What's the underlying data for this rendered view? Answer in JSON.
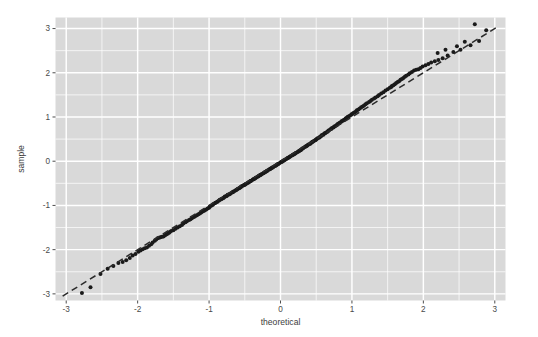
{
  "chart_data": {
    "type": "scatter",
    "title": "",
    "subtitle": "",
    "xlabel": "theoretical",
    "ylabel": "sample",
    "xlim": [
      -3.15,
      3.15
    ],
    "ylim": [
      -3.15,
      3.25
    ],
    "x_ticks": [
      -3,
      -2,
      -1,
      0,
      1,
      2,
      3
    ],
    "x_tick_labels": [
      "-3",
      "-2",
      "-1",
      "0",
      "1",
      "2",
      "3"
    ],
    "y_ticks": [
      -3,
      -2,
      -1,
      0,
      1,
      2,
      3
    ],
    "y_tick_labels": [
      "-3",
      "-2",
      "-1",
      "0",
      "1",
      "2",
      "3"
    ],
    "grid": true,
    "grid_major_step": 1,
    "grid_minor_step": 0.5,
    "legend": "none",
    "panel_background": "#d9d9d9",
    "grid_color": "#ffffff",
    "point_color": "#1a1a1a",
    "point_radius": 2.0,
    "reference_line": {
      "style": "dashed",
      "color": "#2b2b2b",
      "slope": 1.0,
      "intercept": 0.0,
      "x_from": -3.05,
      "x_to": 3.05
    },
    "annotations": [],
    "series": [
      {
        "name": "sample quantiles",
        "n_points": 260,
        "points": [
          [
            -2.66,
            -2.85
          ],
          [
            -2.42,
            -2.43
          ],
          [
            -2.27,
            -2.3
          ],
          [
            -2.16,
            -2.24
          ],
          [
            -2.07,
            -2.13
          ],
          [
            -1.99,
            -2.05
          ],
          [
            -1.93,
            -1.99
          ],
          [
            -1.87,
            -1.95
          ],
          [
            -1.81,
            -1.88
          ],
          [
            -1.76,
            -1.8
          ],
          [
            -1.72,
            -1.74
          ],
          [
            -1.68,
            -1.72
          ],
          [
            -1.64,
            -1.7
          ],
          [
            -1.6,
            -1.66
          ],
          [
            -1.56,
            -1.62
          ],
          [
            -1.53,
            -1.58
          ],
          [
            -1.5,
            -1.56
          ],
          [
            -1.47,
            -1.53
          ],
          [
            -1.44,
            -1.5
          ],
          [
            -1.41,
            -1.47
          ],
          [
            -1.38,
            -1.44
          ],
          [
            -1.36,
            -1.41
          ],
          [
            -1.33,
            -1.38
          ],
          [
            -1.31,
            -1.36
          ],
          [
            -1.28,
            -1.33
          ],
          [
            -1.26,
            -1.31
          ],
          [
            -1.24,
            -1.29
          ],
          [
            -1.21,
            -1.26
          ],
          [
            -1.19,
            -1.24
          ],
          [
            -1.17,
            -1.22
          ],
          [
            -1.15,
            -1.2
          ],
          [
            -1.13,
            -1.18
          ],
          [
            -1.11,
            -1.16
          ],
          [
            -1.09,
            -1.14
          ],
          [
            -1.07,
            -1.12
          ],
          [
            -1.06,
            -1.11
          ],
          [
            -1.04,
            -1.09
          ],
          [
            -1.02,
            -1.07
          ],
          [
            -1.0,
            -1.05
          ],
          [
            -0.99,
            -1.03
          ],
          [
            -0.97,
            -1.01
          ],
          [
            -0.95,
            -0.99
          ],
          [
            -0.94,
            -0.97
          ],
          [
            -0.92,
            -0.95
          ],
          [
            -0.91,
            -0.94
          ],
          [
            -0.89,
            -0.92
          ],
          [
            -0.88,
            -0.91
          ],
          [
            -0.86,
            -0.89
          ],
          [
            -0.85,
            -0.87
          ],
          [
            -0.83,
            -0.86
          ],
          [
            -0.82,
            -0.85
          ],
          [
            -0.8,
            -0.83
          ],
          [
            -0.79,
            -0.82
          ],
          [
            -0.78,
            -0.8
          ],
          [
            -0.76,
            -0.79
          ],
          [
            -0.75,
            -0.78
          ],
          [
            -0.74,
            -0.76
          ],
          [
            -0.72,
            -0.75
          ],
          [
            -0.71,
            -0.74
          ],
          [
            -0.7,
            -0.73
          ],
          [
            -0.68,
            -0.71
          ],
          [
            -0.67,
            -0.7
          ],
          [
            -0.66,
            -0.69
          ],
          [
            -0.65,
            -0.68
          ],
          [
            -0.63,
            -0.66
          ],
          [
            -0.62,
            -0.65
          ],
          [
            -0.61,
            -0.64
          ],
          [
            -0.6,
            -0.63
          ],
          [
            -0.58,
            -0.61
          ],
          [
            -0.57,
            -0.6
          ],
          [
            -0.56,
            -0.59
          ],
          [
            -0.55,
            -0.58
          ],
          [
            -0.54,
            -0.56
          ],
          [
            -0.52,
            -0.55
          ],
          [
            -0.51,
            -0.54
          ],
          [
            -0.5,
            -0.53
          ],
          [
            -0.49,
            -0.52
          ],
          [
            -0.48,
            -0.51
          ],
          [
            -0.46,
            -0.49
          ],
          [
            -0.45,
            -0.48
          ],
          [
            -0.44,
            -0.47
          ],
          [
            -0.43,
            -0.46
          ],
          [
            -0.42,
            -0.45
          ],
          [
            -0.41,
            -0.44
          ],
          [
            -0.39,
            -0.42
          ],
          [
            -0.38,
            -0.41
          ],
          [
            -0.37,
            -0.4
          ],
          [
            -0.36,
            -0.39
          ],
          [
            -0.35,
            -0.38
          ],
          [
            -0.34,
            -0.37
          ],
          [
            -0.32,
            -0.35
          ],
          [
            -0.31,
            -0.34
          ],
          [
            -0.3,
            -0.33
          ],
          [
            -0.29,
            -0.32
          ],
          [
            -0.28,
            -0.31
          ],
          [
            -0.27,
            -0.3
          ],
          [
            -0.26,
            -0.29
          ],
          [
            -0.24,
            -0.27
          ],
          [
            -0.23,
            -0.26
          ],
          [
            -0.22,
            -0.25
          ],
          [
            -0.21,
            -0.24
          ],
          [
            -0.2,
            -0.23
          ],
          [
            -0.19,
            -0.22
          ],
          [
            -0.18,
            -0.21
          ],
          [
            -0.16,
            -0.19
          ],
          [
            -0.15,
            -0.18
          ],
          [
            -0.14,
            -0.17
          ],
          [
            -0.13,
            -0.16
          ],
          [
            -0.12,
            -0.15
          ],
          [
            -0.11,
            -0.14
          ],
          [
            -0.1,
            -0.13
          ],
          [
            -0.08,
            -0.11
          ],
          [
            -0.07,
            -0.1
          ],
          [
            -0.06,
            -0.09
          ],
          [
            -0.05,
            -0.08
          ],
          [
            -0.04,
            -0.07
          ],
          [
            -0.03,
            -0.06
          ],
          [
            -0.02,
            -0.05
          ],
          [
            0.0,
            -0.03
          ],
          [
            0.01,
            -0.02
          ],
          [
            0.02,
            -0.01
          ],
          [
            0.03,
            0.0
          ],
          [
            0.04,
            0.01
          ],
          [
            0.05,
            0.02
          ],
          [
            0.06,
            0.03
          ],
          [
            0.08,
            0.05
          ],
          [
            0.09,
            0.06
          ],
          [
            0.1,
            0.07
          ],
          [
            0.11,
            0.08
          ],
          [
            0.12,
            0.09
          ],
          [
            0.13,
            0.1
          ],
          [
            0.14,
            0.11
          ],
          [
            0.16,
            0.13
          ],
          [
            0.17,
            0.14
          ],
          [
            0.18,
            0.15
          ],
          [
            0.19,
            0.16
          ],
          [
            0.2,
            0.17
          ],
          [
            0.21,
            0.18
          ],
          [
            0.22,
            0.19
          ],
          [
            0.24,
            0.21
          ],
          [
            0.25,
            0.22
          ],
          [
            0.26,
            0.23
          ],
          [
            0.27,
            0.24
          ],
          [
            0.28,
            0.25
          ],
          [
            0.29,
            0.26
          ],
          [
            0.3,
            0.28
          ],
          [
            0.31,
            0.29
          ],
          [
            0.32,
            0.3
          ],
          [
            0.34,
            0.32
          ],
          [
            0.35,
            0.33
          ],
          [
            0.36,
            0.34
          ],
          [
            0.37,
            0.35
          ],
          [
            0.38,
            0.36
          ],
          [
            0.39,
            0.38
          ],
          [
            0.41,
            0.39
          ],
          [
            0.42,
            0.4
          ],
          [
            0.43,
            0.42
          ],
          [
            0.44,
            0.43
          ],
          [
            0.45,
            0.44
          ],
          [
            0.46,
            0.45
          ],
          [
            0.48,
            0.47
          ],
          [
            0.49,
            0.48
          ],
          [
            0.5,
            0.49
          ],
          [
            0.51,
            0.51
          ],
          [
            0.52,
            0.52
          ],
          [
            0.54,
            0.53
          ],
          [
            0.55,
            0.55
          ],
          [
            0.56,
            0.56
          ],
          [
            0.57,
            0.57
          ],
          [
            0.58,
            0.59
          ],
          [
            0.6,
            0.6
          ],
          [
            0.61,
            0.62
          ],
          [
            0.62,
            0.63
          ],
          [
            0.63,
            0.64
          ],
          [
            0.65,
            0.66
          ],
          [
            0.66,
            0.67
          ],
          [
            0.67,
            0.69
          ],
          [
            0.68,
            0.7
          ],
          [
            0.7,
            0.72
          ],
          [
            0.71,
            0.73
          ],
          [
            0.72,
            0.75
          ],
          [
            0.74,
            0.76
          ],
          [
            0.75,
            0.78
          ],
          [
            0.76,
            0.79
          ],
          [
            0.78,
            0.81
          ],
          [
            0.79,
            0.82
          ],
          [
            0.8,
            0.84
          ],
          [
            0.82,
            0.86
          ],
          [
            0.83,
            0.87
          ],
          [
            0.85,
            0.89
          ],
          [
            0.86,
            0.91
          ],
          [
            0.88,
            0.92
          ],
          [
            0.89,
            0.94
          ],
          [
            0.91,
            0.96
          ],
          [
            0.92,
            0.98
          ],
          [
            0.94,
            1.0
          ],
          [
            0.95,
            1.01
          ],
          [
            0.97,
            1.03
          ],
          [
            0.99,
            1.05
          ],
          [
            1.0,
            1.07
          ],
          [
            1.02,
            1.09
          ],
          [
            1.04,
            1.11
          ],
          [
            1.06,
            1.13
          ],
          [
            1.07,
            1.15
          ],
          [
            1.09,
            1.17
          ],
          [
            1.11,
            1.19
          ],
          [
            1.13,
            1.22
          ],
          [
            1.15,
            1.24
          ],
          [
            1.17,
            1.26
          ],
          [
            1.19,
            1.29
          ],
          [
            1.21,
            1.31
          ],
          [
            1.24,
            1.34
          ],
          [
            1.26,
            1.36
          ],
          [
            1.28,
            1.39
          ],
          [
            1.31,
            1.42
          ],
          [
            1.33,
            1.44
          ],
          [
            1.36,
            1.47
          ],
          [
            1.38,
            1.5
          ],
          [
            1.41,
            1.53
          ],
          [
            1.44,
            1.56
          ],
          [
            1.47,
            1.6
          ],
          [
            1.5,
            1.63
          ],
          [
            1.53,
            1.66
          ],
          [
            1.56,
            1.7
          ],
          [
            1.6,
            1.74
          ],
          [
            1.64,
            1.79
          ],
          [
            1.68,
            1.84
          ],
          [
            1.72,
            1.88
          ],
          [
            1.76,
            1.93
          ],
          [
            1.81,
            1.99
          ],
          [
            1.87,
            2.05
          ],
          [
            1.93,
            2.08
          ],
          [
            1.99,
            2.14
          ],
          [
            2.07,
            2.2
          ],
          [
            2.16,
            2.26
          ],
          [
            2.27,
            2.33
          ],
          [
            2.42,
            2.47
          ],
          [
            2.66,
            2.62
          ],
          [
            1.62,
            1.77
          ],
          [
            1.66,
            1.81
          ],
          [
            1.7,
            1.86
          ],
          [
            1.74,
            1.91
          ],
          [
            1.79,
            1.96
          ],
          [
            1.84,
            2.02
          ],
          [
            1.9,
            2.07
          ],
          [
            1.96,
            2.11
          ],
          [
            2.03,
            2.17
          ],
          [
            2.11,
            2.23
          ],
          [
            2.21,
            2.29
          ],
          [
            2.34,
            2.39
          ],
          [
            2.52,
            2.52
          ],
          [
            2.78,
            2.72
          ],
          [
            2.2,
            2.45
          ],
          [
            2.31,
            2.52
          ],
          [
            2.47,
            2.6
          ],
          [
            2.58,
            2.7
          ],
          [
            2.72,
            3.1
          ],
          [
            2.88,
            2.96
          ],
          [
            1.55,
            1.68
          ],
          [
            1.58,
            1.72
          ],
          [
            -2.78,
            -2.98
          ],
          [
            -2.52,
            -2.55
          ],
          [
            -2.34,
            -2.37
          ],
          [
            -2.21,
            -2.28
          ],
          [
            -2.11,
            -2.19
          ],
          [
            -2.03,
            -2.1
          ],
          [
            -1.96,
            -2.02
          ],
          [
            -1.9,
            -1.97
          ],
          [
            -1.84,
            -1.91
          ],
          [
            -1.79,
            -1.84
          ],
          [
            -1.74,
            -1.77
          ],
          [
            -1.7,
            -1.73
          ],
          [
            -1.66,
            -1.71
          ],
          [
            -1.62,
            -1.68
          ],
          [
            -1.58,
            -1.64
          ],
          [
            -1.55,
            -1.6
          ]
        ]
      }
    ]
  }
}
